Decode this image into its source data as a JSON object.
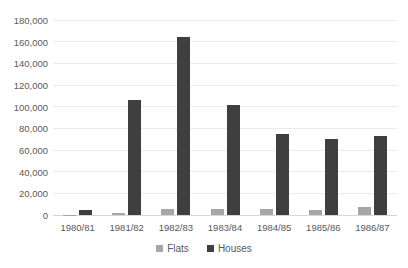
{
  "chart_data": {
    "type": "bar",
    "title": "",
    "xlabel": "",
    "ylabel": "",
    "categories": [
      "1980/81",
      "1981/82",
      "1982/83",
      "1983/84",
      "1984/85",
      "1985/86",
      "1986/87"
    ],
    "series": [
      {
        "name": "Flats",
        "color": "#a6a6a6",
        "values": [
          400,
          1800,
          6000,
          5500,
          6000,
          4500,
          7500
        ]
      },
      {
        "name": "Houses",
        "color": "#3f3f3f",
        "values": [
          4500,
          106000,
          164000,
          102000,
          75000,
          70000,
          72500
        ]
      }
    ],
    "ylim": [
      0,
      180000
    ],
    "ytick_step": 20000,
    "ytick_labels": [
      "0",
      "20,000",
      "40,000",
      "60,000",
      "80,000",
      "100,000",
      "120,000",
      "140,000",
      "160,000",
      "180,000"
    ],
    "grid": true,
    "legend_position": "bottom-center"
  },
  "colors": {
    "background": "#ffffff",
    "gridline": "#ebebeb",
    "axis_line": "#d6d6d6",
    "tick_text": "#595959"
  }
}
